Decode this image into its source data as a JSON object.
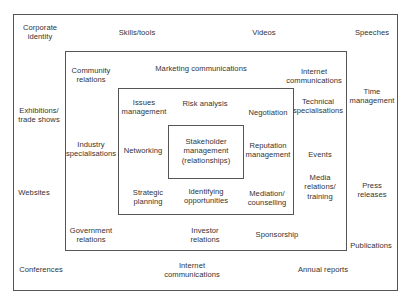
{
  "diagram": {
    "type": "nested-boxes",
    "outer_ring": {
      "items": [
        {
          "label": "Corporate\nidentity",
          "x": 40,
          "y": 32
        },
        {
          "label": "Skills/tools",
          "x": 137,
          "y": 33
        },
        {
          "label": "Videos",
          "x": 264,
          "y": 33
        },
        {
          "label": "Speeches",
          "x": 372,
          "y": 33
        },
        {
          "label": "Time\nmanagement",
          "x": 372,
          "y": 96
        },
        {
          "label": "Exhibitions/\ntrade shows",
          "x": 39,
          "y": 115
        },
        {
          "label": "Websites",
          "x": 34,
          "y": 193
        },
        {
          "label": "Press\nreleases",
          "x": 372,
          "y": 190
        },
        {
          "label": "Publications",
          "x": 371,
          "y": 246
        },
        {
          "label": "Conferences",
          "x": 41,
          "y": 270
        },
        {
          "label": "Internet\ncommunications",
          "x": 192,
          "y": 270
        },
        {
          "label": "Annual reports",
          "x": 323,
          "y": 270
        }
      ]
    },
    "second_ring": {
      "items": [
        {
          "label": "Community\nrelations",
          "x": 91,
          "y": 75
        },
        {
          "label": "Marketing communications",
          "x": 201,
          "y": 69
        },
        {
          "label": "Internet\ncommunications",
          "x": 314,
          "y": 76
        },
        {
          "label": "Technical\nspecialisations",
          "x": 317,
          "y": 106
        },
        {
          "label": "Industry\nspecialisations",
          "x": 91,
          "y": 149
        },
        {
          "label": "Events",
          "x": 320,
          "y": 155
        },
        {
          "label": "Media\nrelations/\ntraining",
          "x": 320,
          "y": 187
        },
        {
          "label": "Government\nrelations",
          "x": 91,
          "y": 235
        },
        {
          "label": "Investor\nrelations",
          "x": 205,
          "y": 235
        },
        {
          "label": "Sponsorship",
          "x": 277,
          "y": 235
        }
      ]
    },
    "third_ring": {
      "items": [
        {
          "label": "Issues\nmanagement",
          "x": 144,
          "y": 107
        },
        {
          "label": "Risk analysis",
          "x": 205,
          "y": 104
        },
        {
          "label": "Negotiation",
          "x": 268,
          "y": 113
        },
        {
          "label": "Networking",
          "x": 143,
          "y": 151
        },
        {
          "label": "Reputation\nmanagement",
          "x": 268,
          "y": 150
        },
        {
          "label": "Strategic\nplanning",
          "x": 148,
          "y": 197
        },
        {
          "label": "Identifying\nopportunities",
          "x": 206,
          "y": 196
        },
        {
          "label": "Mediation/\ncounselling",
          "x": 267,
          "y": 198
        }
      ]
    },
    "core": {
      "label": "Stakeholder\nmanagement\n(relationships)",
      "x": 206,
      "y": 151
    },
    "colors": {
      "border": "#555555",
      "text": "#333333",
      "background": "#ffffff"
    }
  }
}
